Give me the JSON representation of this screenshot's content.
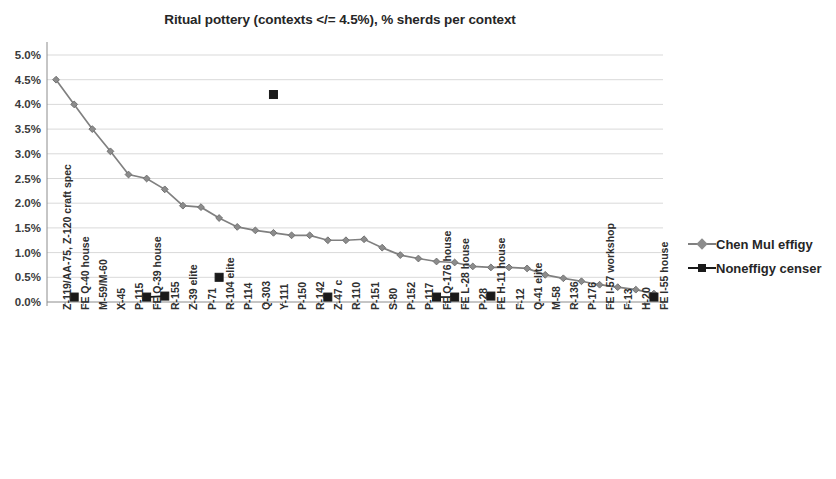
{
  "chart_data": {
    "type": "line",
    "title": "Ritual pottery (contexts </= 4.5%), % sherds per context",
    "xlabel": "",
    "ylabel": "",
    "ylim": [
      0,
      5
    ],
    "ytick_labels": [
      "0.0%",
      "0.5%",
      "1.0%",
      "1.5%",
      "2.0%",
      "2.5%",
      "3.0%",
      "3.5%",
      "4.0%",
      "4.5%",
      "5.0%"
    ],
    "ytick_values": [
      0,
      0.5,
      1,
      1.5,
      2,
      2.5,
      3,
      3.5,
      4,
      4.5,
      5
    ],
    "grid": true,
    "legend_position": "right",
    "categories": [
      "Z-119/AA-75, Z-120 craft spec",
      "FE Q-40 house",
      "M-59/M-60",
      "X-45",
      "P-115",
      "FE Q-39 house",
      "R-155",
      "Z-39 elite",
      "P-71",
      "R-104 elite",
      "P-114",
      "Q-303",
      "Y-111",
      "P-150",
      "R-142",
      "Z-47 c",
      "R-110",
      "P-151",
      "S-80",
      "P-152",
      "P-117",
      "FE Q-176 house",
      "FE L-28 house",
      "P-28",
      "FE H-11 house",
      "F-12",
      "Q-41 elite",
      "M-58",
      "R-136",
      "P-176",
      "FE I-57 workshop",
      "F-13",
      "H-20",
      "FE I-55 house"
    ],
    "series": [
      {
        "name": "Chen Mul effigy",
        "color": "#808080",
        "marker": "diamond",
        "values": [
          4.5,
          4.0,
          3.5,
          3.05,
          2.58,
          2.5,
          2.28,
          1.95,
          1.92,
          1.7,
          1.52,
          1.45,
          1.4,
          1.35,
          1.35,
          1.25,
          1.25,
          1.27,
          1.1,
          0.95,
          0.88,
          0.82,
          0.8,
          0.72,
          0.7,
          0.7,
          0.68,
          0.55,
          0.48,
          0.42,
          0.35,
          0.3,
          0.25,
          0.17
        ]
      },
      {
        "name": "Noneffigy censer",
        "color": "#1a1a1a",
        "marker": "square",
        "values": [
          null,
          0.1,
          null,
          null,
          null,
          0.1,
          0.12,
          null,
          null,
          0.5,
          null,
          null,
          4.2,
          null,
          null,
          0.1,
          null,
          null,
          null,
          null,
          null,
          0.1,
          0.1,
          null,
          0.12,
          null,
          null,
          null,
          null,
          null,
          null,
          null,
          null,
          0.1
        ]
      }
    ]
  },
  "legend": {
    "items": [
      {
        "label": "Chen Mul effigy"
      },
      {
        "label": "Noneffigy censer"
      }
    ]
  }
}
